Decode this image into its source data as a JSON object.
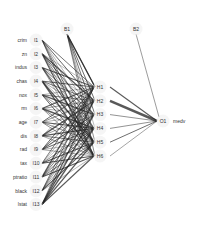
{
  "diagram": {
    "type": "neural-network",
    "input_layer": {
      "nodes": [
        "I1",
        "I2",
        "I3",
        "I4",
        "I5",
        "I6",
        "I7",
        "I8",
        "I9",
        "I10",
        "I11",
        "I12",
        "I13"
      ],
      "variables": [
        "crim",
        "zn",
        "indus",
        "chas",
        "nox",
        "rm",
        "age",
        "dis",
        "rad",
        "tax",
        "ptratio",
        "black",
        "lstat"
      ]
    },
    "hidden_layer": {
      "nodes": [
        "H1",
        "H2",
        "H3",
        "H4",
        "H5",
        "H6"
      ]
    },
    "output_layer": {
      "nodes": [
        "O1"
      ],
      "variables": [
        "medv"
      ]
    },
    "bias_nodes": [
      "B1",
      "B2"
    ],
    "colors": {
      "edge": "#222222",
      "node_fill": "#eeeeee",
      "label": "#333333",
      "background": "#ffffff"
    },
    "hidden_to_output_weights": [
      2.0,
      4.5,
      1.2,
      1.2,
      1.6,
      1.0
    ]
  }
}
